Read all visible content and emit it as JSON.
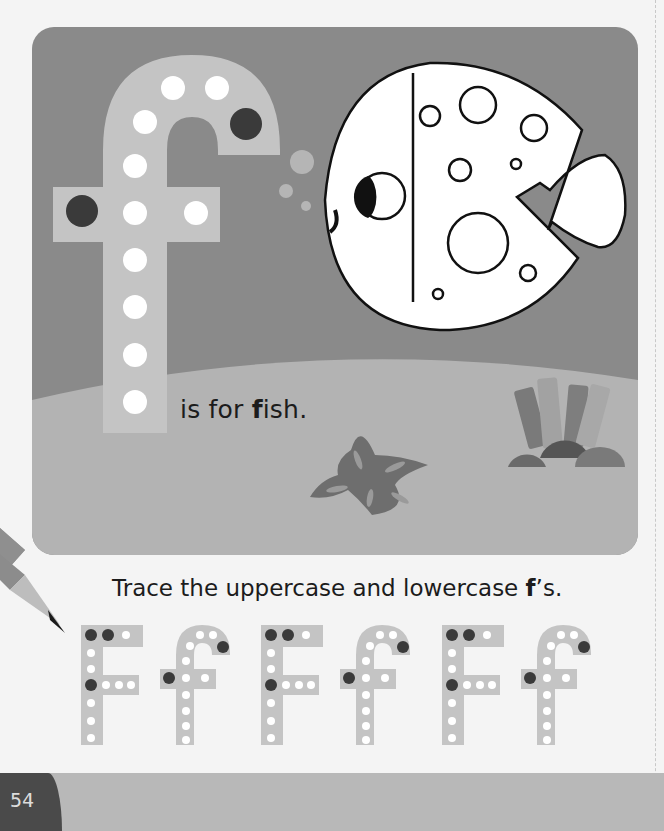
{
  "scene": {
    "caption_pre": "is for ",
    "caption_bold": "f",
    "caption_post": "ish.",
    "letter": "f",
    "subject": "fish",
    "colors": {
      "water": "#8a8a8a",
      "sand": "#b3b3b3",
      "letter_fill": "#c4c4c4",
      "dot_white": "#ffffff",
      "dot_dark": "#3a3a3a",
      "starfish": "#6e6e6e",
      "coral_dark": "#5e5e5e"
    }
  },
  "activity": {
    "instruction_pre": "Trace the uppercase and lowercase ",
    "instruction_bold": "f",
    "instruction_post": "’s.",
    "letters": [
      "F",
      "f",
      "F",
      "f",
      "F",
      "f"
    ]
  },
  "footer": {
    "page_number": "54"
  }
}
